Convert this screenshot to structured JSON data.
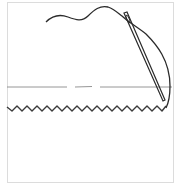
{
  "diagram": {
    "elements": [
      {
        "id": "thread",
        "label": "thread"
      },
      {
        "id": "needle",
        "label": "needle"
      },
      {
        "id": "fold-line",
        "label": "fold line (dashed)"
      },
      {
        "id": "zigzag-stitch",
        "label": "zigzag stitch edge",
        "peaks": 16
      }
    ],
    "colors": {
      "stroke": "#2b2b2b",
      "fold_line": "#8a8a8a",
      "frame": "#dcdcdc",
      "background": "#ffffff"
    }
  }
}
